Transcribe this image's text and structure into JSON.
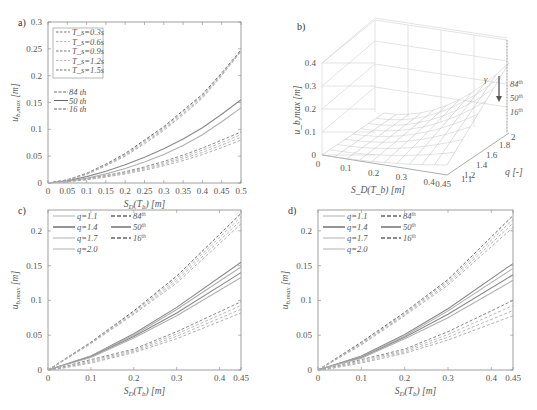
{
  "chart_data": [
    {
      "panel": "a)",
      "type": "line",
      "title": "",
      "xlabel": "S_D(T_b) [m]",
      "ylabel": "u_b,max [m]",
      "xlim": [
        0,
        0.5
      ],
      "ylim": [
        0,
        0.3
      ],
      "xticks": [
        "0",
        "0.05",
        "0.1",
        "0.15",
        "0.2",
        "0.25",
        "0.3",
        "0.35",
        "0.4",
        "0.45",
        "0.5"
      ],
      "yticks": [
        "0",
        "0.05",
        "0.1",
        "0.15",
        "0.2",
        "0.25",
        "0.3"
      ],
      "grid": false,
      "legend_position": "upper left",
      "legend": [
        "T_s=0.3s",
        "T_s=0.6s",
        "T_s=0.9s",
        "T_s=1.2s",
        "T_s=1.5s"
      ],
      "legend2": [
        "84 th",
        "50 th",
        "16 th"
      ],
      "x": [
        0,
        0.05,
        0.1,
        0.15,
        0.2,
        0.25,
        0.3,
        0.35,
        0.4,
        0.45,
        0.5
      ],
      "series": [
        {
          "name": "84 th (T_s=0.3s)",
          "style": "dashed",
          "values": [
            0,
            0.006,
            0.018,
            0.035,
            0.055,
            0.08,
            0.105,
            0.135,
            0.165,
            0.205,
            0.248
          ]
        },
        {
          "name": "84 th (T_s=1.5s)",
          "style": "dashed",
          "values": [
            0,
            0.005,
            0.016,
            0.032,
            0.05,
            0.073,
            0.098,
            0.127,
            0.158,
            0.2,
            0.245
          ]
        },
        {
          "name": "50 th (T_s=0.3s)",
          "style": "solid",
          "values": [
            0,
            0.004,
            0.012,
            0.022,
            0.034,
            0.048,
            0.064,
            0.082,
            0.103,
            0.128,
            0.155
          ]
        },
        {
          "name": "50 th (T_s=1.5s)",
          "style": "solid",
          "values": [
            0,
            0.003,
            0.009,
            0.017,
            0.027,
            0.039,
            0.053,
            0.07,
            0.09,
            0.114,
            0.14
          ]
        },
        {
          "name": "16 th (T_s=0.3s)",
          "style": "dashed",
          "values": [
            0,
            0.003,
            0.008,
            0.014,
            0.021,
            0.03,
            0.04,
            0.052,
            0.065,
            0.08,
            0.095
          ]
        },
        {
          "name": "16 th (T_s=1.5s)",
          "style": "dashed",
          "values": [
            0,
            0.002,
            0.006,
            0.011,
            0.017,
            0.024,
            0.032,
            0.042,
            0.053,
            0.066,
            0.08
          ]
        }
      ]
    },
    {
      "panel": "b)",
      "type": "surface3d",
      "xlabel": "S_D(T_b) [m]",
      "ylabel": "q [-]",
      "zlabel": "u_b,max [m]",
      "xticks": [
        "0",
        "0.1",
        "0.2",
        "0.3",
        "0.4",
        "0.45"
      ],
      "yticks": [
        "1.1",
        "1.2",
        "1.4",
        "1.6",
        "1.8",
        "2"
      ],
      "zticks": [
        "0",
        "0.1",
        "0.2",
        "0.3",
        "0.4"
      ],
      "annotations": [
        "84th",
        "50th",
        "16th",
        "γ"
      ]
    },
    {
      "panel": "c)",
      "type": "line",
      "xlabel": "S_D(T_b) [m]",
      "ylabel": "u_b,max [m]",
      "xlim": [
        0,
        0.45
      ],
      "ylim": [
        0,
        0.23
      ],
      "xticks": [
        "0",
        "0.1",
        "0.2",
        "0.3",
        "0.4",
        "0.45"
      ],
      "yticks": [
        "0",
        "0.05",
        "0.1",
        "0.15",
        "0.2"
      ],
      "legend": [
        "q=1.1",
        "q=1.4",
        "q=1.7",
        "q=2.0"
      ],
      "legend2": [
        "84th",
        "50th",
        "16th"
      ],
      "x": [
        0,
        0.02,
        0.1,
        0.2,
        0.3,
        0.45
      ],
      "series": [
        {
          "name": "84th q=1.1",
          "style": "dashed",
          "values": [
            0,
            0.008,
            0.04,
            0.085,
            0.135,
            0.225
          ]
        },
        {
          "name": "84th q=2.0",
          "style": "dashed",
          "values": [
            0,
            0.007,
            0.038,
            0.08,
            0.125,
            0.21
          ]
        },
        {
          "name": "50th q=1.1",
          "style": "solid",
          "values": [
            0,
            0.004,
            0.02,
            0.052,
            0.09,
            0.155
          ]
        },
        {
          "name": "50th q=1.4",
          "style": "solid",
          "values": [
            0,
            0.004,
            0.02,
            0.05,
            0.087,
            0.148
          ]
        },
        {
          "name": "50th q=1.7",
          "style": "solid",
          "values": [
            0,
            0.004,
            0.019,
            0.048,
            0.082,
            0.14
          ]
        },
        {
          "name": "50th q=2.0",
          "style": "solid",
          "values": [
            0,
            0.004,
            0.018,
            0.046,
            0.078,
            0.133
          ]
        },
        {
          "name": "16th q=1.1",
          "style": "dashed",
          "values": [
            0,
            0.002,
            0.015,
            0.03,
            0.055,
            0.098
          ]
        },
        {
          "name": "16th q=2.0",
          "style": "dashed",
          "values": [
            0,
            0.001,
            0.01,
            0.025,
            0.045,
            0.082
          ]
        }
      ]
    },
    {
      "panel": "d)",
      "type": "line",
      "xlabel": "S_D(T_b) [m]",
      "ylabel": "u_b,max [m]",
      "xlim": [
        0,
        0.45
      ],
      "ylim": [
        0,
        0.23
      ],
      "xticks": [
        "0",
        "0.1",
        "0.2",
        "0.3",
        "0.4",
        "0.45"
      ],
      "yticks": [
        "0",
        "0.05",
        "0.1",
        "0.15",
        "0.2"
      ],
      "legend": [
        "q=1.1",
        "q=1.4",
        "q=1.7",
        "q=2.0"
      ],
      "legend2": [
        "84th",
        "50th",
        "16th"
      ],
      "x": [
        0,
        0.02,
        0.1,
        0.2,
        0.3,
        0.45
      ],
      "series": [
        {
          "name": "84th q=1.1",
          "style": "dashed",
          "values": [
            0,
            0.008,
            0.04,
            0.083,
            0.13,
            0.222
          ]
        },
        {
          "name": "84th q=2.0",
          "style": "dashed",
          "values": [
            0,
            0.007,
            0.036,
            0.078,
            0.122,
            0.205
          ]
        },
        {
          "name": "50th q=1.1",
          "style": "solid",
          "values": [
            0,
            0.004,
            0.02,
            0.051,
            0.088,
            0.153
          ]
        },
        {
          "name": "50th q=1.4",
          "style": "solid",
          "values": [
            0,
            0.004,
            0.019,
            0.049,
            0.085,
            0.146
          ]
        },
        {
          "name": "50th q=1.7",
          "style": "solid",
          "values": [
            0,
            0.004,
            0.018,
            0.047,
            0.08,
            0.137
          ]
        },
        {
          "name": "50th q=2.0",
          "style": "solid",
          "values": [
            0,
            0.004,
            0.017,
            0.045,
            0.075,
            0.129
          ]
        },
        {
          "name": "16th q=1.1",
          "style": "dashed",
          "values": [
            0,
            0.002,
            0.015,
            0.03,
            0.055,
            0.1
          ]
        },
        {
          "name": "16th q=2.0",
          "style": "dashed",
          "values": [
            0,
            0.001,
            0.01,
            0.024,
            0.043,
            0.078
          ]
        }
      ]
    }
  ],
  "labels": {
    "a": "a)",
    "b": "b)",
    "c": "c)",
    "d": "d)",
    "xlabel": "S",
    "xlabel_sub": "D",
    "xlabel_rest": "(T",
    "xlabel_sub2": "b",
    "xlabel_unit": ") [m]",
    "ylabel": "u",
    "ylabel_sub": "b,max",
    "ylabel_unit": " [m]",
    "qlabel": "q [-]",
    "gamma": "γ"
  },
  "colors": {
    "axis": "#888888",
    "line_dark": "#666666",
    "line_mid": "#8a8a8a",
    "line_light": "#b0b0b0",
    "grid3d": "#d0d0d0"
  }
}
